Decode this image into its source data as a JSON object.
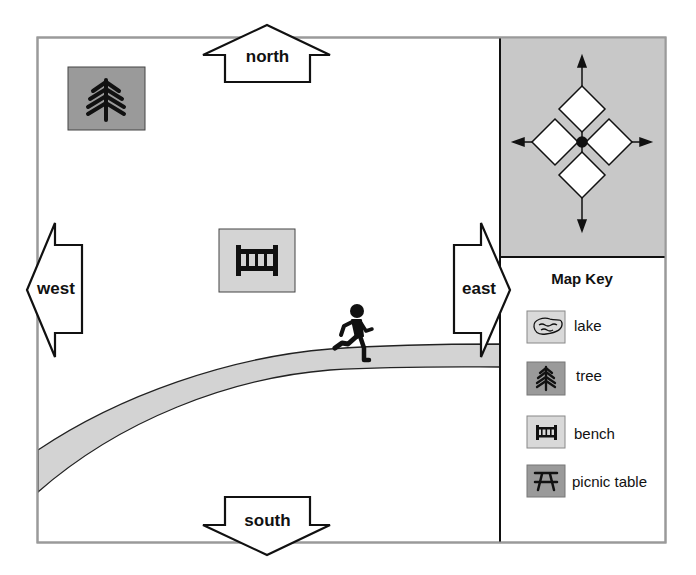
{
  "directions": {
    "north": "north",
    "south": "south",
    "east": "east",
    "west": "west"
  },
  "map_key": {
    "title": "Map Key",
    "items": [
      {
        "icon": "lake-icon",
        "label": "lake",
        "box_color": "#d9d9d9"
      },
      {
        "icon": "tree-icon",
        "label": "tree",
        "box_color": "#9a9a9a"
      },
      {
        "icon": "bench-icon",
        "label": "bench",
        "box_color": "#d9d9d9"
      },
      {
        "icon": "picnic-table-icon",
        "label": "picnic table",
        "box_color": "#9a9a9a"
      }
    ]
  },
  "map_features": [
    {
      "type": "tree",
      "box_color": "#9a9a9a"
    },
    {
      "type": "bench",
      "box_color": "#d4d4d4"
    },
    {
      "type": "path",
      "color": "#d3d3d3"
    },
    {
      "type": "runner"
    }
  ],
  "compass": {
    "panel_color": "#c8c8c8"
  }
}
